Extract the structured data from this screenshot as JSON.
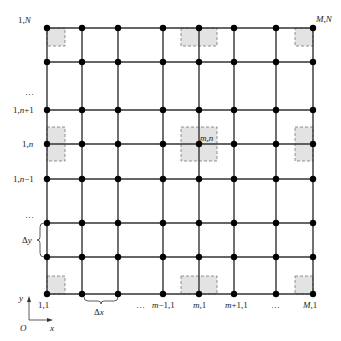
{
  "diagram": {
    "type": "finite-difference grid",
    "columns_x": [
      47,
      82,
      118,
      163,
      199,
      234,
      276,
      313
    ],
    "rows_y": [
      28,
      62,
      110,
      144,
      179,
      223,
      257,
      294
    ],
    "corner_labels": {
      "top_left": "1,N",
      "top_right": "M,N",
      "bottom_left": "1,1"
    },
    "left_labels": [
      "…",
      "1,n+1",
      "1,n",
      "1,n−1",
      "…"
    ],
    "bottom_labels": [
      "…",
      "m−1,1",
      "m,1",
      "m+1,1",
      "…",
      "M,1"
    ],
    "center_label": "m,n",
    "spacing": {
      "dy": "Δy",
      "dx": "Δx"
    },
    "axes": {
      "y": "y",
      "x": "x",
      "origin": "O"
    },
    "colors": {
      "line": "#333333",
      "node": "#000000",
      "cell_fill": "#e3e3e3",
      "cell_border": "#777777"
    }
  }
}
